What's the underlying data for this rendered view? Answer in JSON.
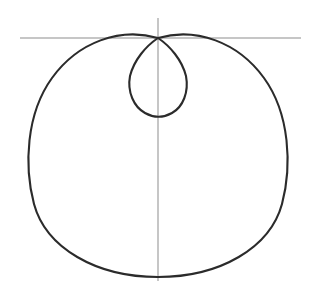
{
  "figure": {
    "background_color": "#ffffff",
    "width": 317,
    "height": 295
  },
  "style": {
    "curve_color": "#2b2b2b",
    "curve_width": 2.1,
    "axis_color": "#8d8d8d",
    "axis_width": 1
  },
  "axes": {
    "horizontal": {
      "label": "horizontal-axis",
      "x1": 20,
      "y1": 38,
      "x2": 301,
      "y2": 38
    },
    "vertical": {
      "label": "vertical-axis",
      "x1": 158,
      "y1": 18,
      "x2": 158,
      "y2": 281
    },
    "origin": {
      "x": 158,
      "y": 38
    }
  },
  "chart_data": {
    "type": "line",
    "subtitle": "",
    "xlabel": "",
    "ylabel": "",
    "grid": false,
    "legend": null,
    "polar": true,
    "equation": "r = a + b*cos(theta), b > a",
    "parameters": {
      "a": 0.535,
      "b": 1.0
    },
    "pole": {
      "x": 158,
      "y": 38
    },
    "scale_px_per_unit": 78,
    "orientation": "cusp at top, outer loop opening downward",
    "xlim": [
      25,
      292
    ],
    "ylim": [
      30,
      277
    ],
    "outer_loop": {
      "name": "outer-loop",
      "left_x": 25,
      "right_x": 292,
      "top_y": 30,
      "bottom_y": 277,
      "width": 267,
      "height": 247
    },
    "inner_loop": {
      "name": "inner-loop",
      "left_x": 130,
      "right_x": 188,
      "top_y": 38,
      "bottom_y": 116,
      "width": 58,
      "height": 78
    },
    "annotations": [],
    "series": [
      {
        "name": "outer-loop",
        "closed": true,
        "path": "M 158 38 C 120 27 78 42 52 78 C 26 114 24 166 34 204 C 46 248 96 277 158 277 C 220 277 270 248 282 204 C 292 166 290 114 264 78 C 238 42 196 27 158 38 Z"
      },
      {
        "name": "inner-loop",
        "closed": true,
        "path": "M 158 38 C 146 46 134 60 130 76 C 127 92 134 107 145 113 C 154 118 163 118 172 113 C 183 107 189 92 186 76 C 182 60 170 46 158 38 Z"
      }
    ]
  }
}
